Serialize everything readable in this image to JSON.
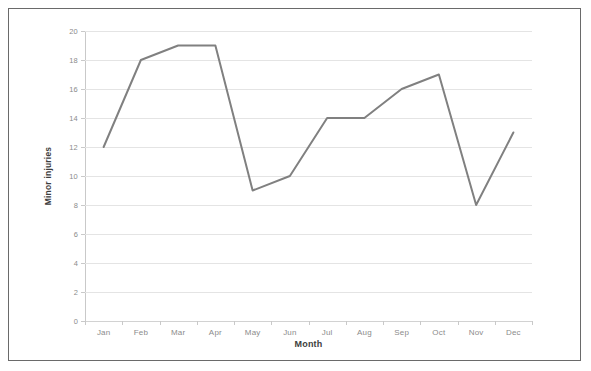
{
  "chart_data": {
    "type": "line",
    "title": "",
    "xlabel": "Month",
    "ylabel": "Minor injuries",
    "categories": [
      "Jan",
      "Feb",
      "Mar",
      "Apr",
      "May",
      "Jun",
      "Jul",
      "Aug",
      "Sep",
      "Oct",
      "Nov",
      "Dec"
    ],
    "series": [
      {
        "name": "Minor injuries",
        "values": [
          12,
          18,
          19,
          19,
          9,
          10,
          14,
          14,
          16,
          17,
          8,
          13
        ],
        "color": "#808080"
      }
    ],
    "ylim": [
      0,
      20
    ],
    "ytick_labels": [
      "0",
      "2",
      "4",
      "6",
      "8",
      "10",
      "12",
      "14",
      "16",
      "18",
      "20"
    ],
    "ytick_values": [
      0,
      2,
      4,
      6,
      8,
      10,
      12,
      14,
      16,
      18,
      20
    ],
    "grid": true,
    "legend": false,
    "legend_position": "none",
    "gridline_color": "#e4e4e4",
    "border_color": "#6a6a6a",
    "background_color": "#ffffff"
  }
}
